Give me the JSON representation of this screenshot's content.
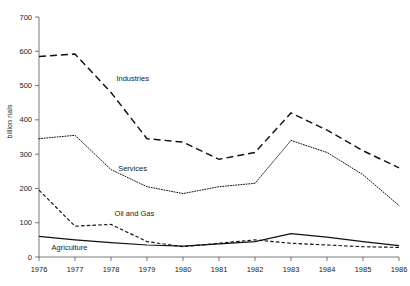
{
  "chart_data": {
    "type": "line",
    "title": "",
    "xlabel": "",
    "ylabel": "billion rials",
    "x": [
      1976,
      1977,
      1978,
      1979,
      1980,
      1981,
      1982,
      1983,
      1984,
      1985,
      1986
    ],
    "xticklabels": [
      "1976",
      "1977",
      "1978",
      "1979",
      "1980",
      "1981",
      "1982",
      "1983",
      "1984",
      "1985",
      "1986"
    ],
    "yticklabels": [
      "0",
      "100",
      "200",
      "300",
      "400",
      "500",
      "600",
      "700"
    ],
    "yticks": [
      0,
      100,
      200,
      300,
      400,
      500,
      600,
      700
    ],
    "ylim": [
      0,
      700
    ],
    "xlim": [
      1976,
      1986
    ],
    "grid": false,
    "legend": "inline-annotations",
    "series": [
      {
        "name": "Industries",
        "style": "dashed",
        "color": "#111111",
        "label_x": 1978.15,
        "label_y": 520,
        "values": [
          585,
          592,
          480,
          345,
          335,
          285,
          305,
          420,
          370,
          310,
          260
        ]
      },
      {
        "name": "Services",
        "style": "dotted",
        "color": "#111111",
        "label_x": 1978.2,
        "label_y": 258,
        "values": [
          345,
          355,
          255,
          205,
          185,
          205,
          215,
          340,
          305,
          240,
          150
        ]
      },
      {
        "name": "Oil and Gas",
        "style": "dashed-fine",
        "color": "#111111",
        "label_x": 1978.1,
        "label_y": 128,
        "values": [
          195,
          90,
          95,
          45,
          30,
          40,
          50,
          40,
          35,
          30,
          28
        ]
      },
      {
        "name": "Agriculture",
        "style": "solid",
        "color": "#111111",
        "label_x": 1976.35,
        "label_y": 28,
        "values": [
          60,
          50,
          42,
          35,
          32,
          38,
          45,
          68,
          58,
          45,
          33
        ]
      }
    ],
    "annotations": [
      {
        "text": "Industries",
        "x": 1978.15,
        "y": 520
      },
      {
        "text": "Services",
        "x": 1978.2,
        "y": 258
      },
      {
        "text": "Oil and Gas",
        "x": 1978.1,
        "y": 128
      },
      {
        "text": "Agriculture",
        "x": 1976.35,
        "y": 28
      }
    ]
  },
  "colors": {
    "axis": "#555555",
    "text": "#1a1a1a",
    "line": "#111111",
    "background": "#ffffff"
  }
}
